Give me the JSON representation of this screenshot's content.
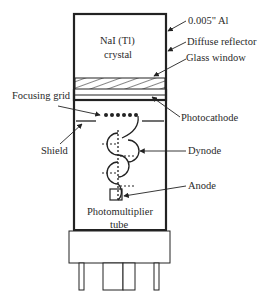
{
  "diagram": {
    "labels": {
      "crystal_line1": "NaI (Tl)",
      "crystal_line2": "crystal",
      "al_housing": "0.005\" Al",
      "diffuse_reflector": "Diffuse reflector",
      "glass_window": "Glass window",
      "focusing_grid": "Focusing grid",
      "photocathode": "Photocathode",
      "shield": "Shield",
      "dynode": "Dynode",
      "anode": "Anode",
      "pmt_line1": "Photomultiplier",
      "pmt_line2": "tube"
    },
    "colors": {
      "stroke": "#222222",
      "background": "#ffffff"
    }
  }
}
